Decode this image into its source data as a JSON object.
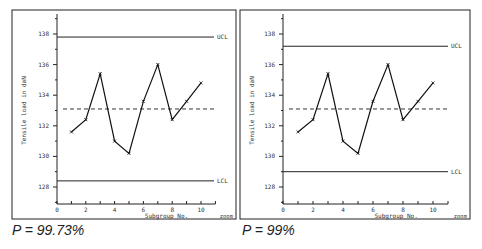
{
  "chart_data": [
    {
      "type": "line",
      "title": "",
      "caption": "P = 99.73%",
      "xlabel": "Subgroup No.",
      "ylabel": "Tensile load in daN",
      "corner_label": "zoom",
      "x": [
        1,
        2,
        3,
        4,
        5,
        6,
        7,
        8,
        9,
        10
      ],
      "values": [
        131.6,
        132.4,
        135.4,
        131.0,
        130.2,
        133.6,
        136.0,
        132.4,
        133.6,
        134.8
      ],
      "ucl": 137.8,
      "ucl_label": "UCL",
      "lcl": 128.4,
      "lcl_label": "LCL",
      "center_line": 133.1,
      "xlim": [
        0,
        11
      ],
      "ylim": [
        127,
        139.5
      ],
      "xticks": [
        0,
        2,
        4,
        6,
        8,
        10
      ],
      "yticks": [
        128,
        130,
        132,
        134,
        136,
        138
      ],
      "grid": false
    },
    {
      "type": "line",
      "title": "",
      "caption": "P = 99%",
      "xlabel": "Subgroup No.",
      "ylabel": "Tensile load in daN",
      "corner_label": "zoom",
      "x": [
        1,
        2,
        3,
        4,
        5,
        6,
        7,
        8,
        9,
        10
      ],
      "values": [
        131.6,
        132.4,
        135.4,
        131.0,
        130.2,
        133.6,
        136.0,
        132.4,
        133.6,
        134.8
      ],
      "ucl": 137.2,
      "ucl_label": "UCL",
      "lcl": 129.0,
      "lcl_label": "LCL",
      "center_line": 133.1,
      "xlim": [
        0,
        11
      ],
      "ylim": [
        127,
        139.5
      ],
      "xticks": [
        0,
        2,
        4,
        6,
        8,
        10
      ],
      "yticks": [
        128,
        130,
        132,
        134,
        136,
        138
      ],
      "grid": false
    }
  ]
}
